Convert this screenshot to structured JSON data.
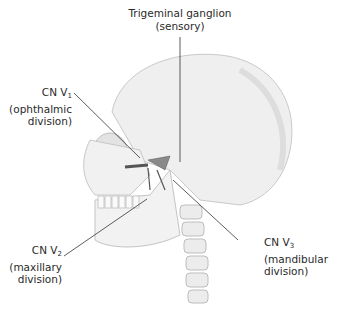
{
  "figure": {
    "labels": {
      "ganglion": {
        "line1": "Trigeminal ganglion",
        "line2": "(sensory)"
      },
      "v1": {
        "prefix": "CN V",
        "sub": "1",
        "line2": "(ophthalmic",
        "line3": "division)"
      },
      "v2": {
        "prefix": "CN V",
        "sub": "2",
        "line2": "(maxillary",
        "line3": "division)"
      },
      "v3": {
        "prefix": "CN V",
        "sub": "3",
        "line2": "(mandibular",
        "line3": "division)"
      }
    },
    "colors": {
      "bone": "#eeeeee",
      "bone_shade": "#d6d6d6",
      "nerve": "#555555",
      "leader": "#333333"
    }
  }
}
